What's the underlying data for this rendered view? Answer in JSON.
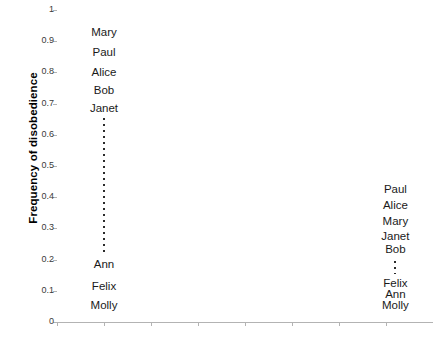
{
  "chart_data": {
    "type": "scatter",
    "title": "",
    "xlabel": "",
    "ylabel": "Frequency of disobedience",
    "ylim": [
      0,
      1
    ],
    "yticks": [
      "0",
      "0.1",
      "0.2",
      "0.3",
      "0.4",
      "0.5",
      "0.6",
      "0.7",
      "0.8",
      "0.9",
      "1"
    ],
    "ytick_values": [
      0,
      0.1,
      0.2,
      0.3,
      0.4,
      0.5,
      0.6,
      0.7,
      0.8,
      0.9,
      1
    ],
    "xlim": [
      0,
      8
    ],
    "xticks": [
      "",
      "",
      "",
      "",
      "",
      "",
      "",
      "",
      ""
    ],
    "xtick_values": [
      0,
      1,
      2,
      3,
      4,
      5,
      6,
      7,
      8
    ],
    "grid": false,
    "legend": null,
    "series": [
      {
        "name": "left-group",
        "x": 1,
        "labels": [
          {
            "text": "Mary",
            "value": 0.93
          },
          {
            "text": "Paul",
            "value": 0.865
          },
          {
            "text": "Alice",
            "value": 0.8
          },
          {
            "text": "Bob",
            "value": 0.745
          },
          {
            "text": "Janet",
            "value": 0.685
          },
          {
            "text": "Ann",
            "value": 0.185
          },
          {
            "text": "Felix",
            "value": 0.115
          },
          {
            "text": "Molly",
            "value": 0.055
          }
        ],
        "ellipsis": {
          "from": 0.21,
          "to": 0.655
        }
      },
      {
        "name": "right-group",
        "x": 7.2,
        "labels": [
          {
            "text": "Paul",
            "value": 0.425
          },
          {
            "text": "Alice",
            "value": 0.375
          },
          {
            "text": "Mary",
            "value": 0.325
          },
          {
            "text": "Janet",
            "value": 0.275
          },
          {
            "text": "Bob",
            "value": 0.235
          },
          {
            "text": "Felix",
            "value": 0.125
          },
          {
            "text": "Ann",
            "value": 0.09
          },
          {
            "text": "Molly",
            "value": 0.055
          }
        ],
        "ellipsis": {
          "from": 0.155,
          "to": 0.195
        }
      }
    ]
  },
  "colors": {
    "axis": "#b3b3b3",
    "text": "#1a1a1a",
    "tick_text": "#3a3a3a",
    "dots": "#2b2b2b",
    "background": "#ffffff"
  }
}
